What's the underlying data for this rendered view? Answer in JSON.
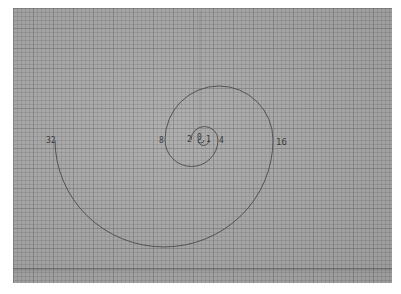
{
  "scene": {
    "description": "Photograph of grid paper with a hand-drawn spiral made of semicircular arcs whose diameters double",
    "paper_color": "#a9a9a9",
    "ink_color": "#4a4a4a"
  },
  "labels": {
    "zero": "0",
    "one": "1",
    "two": "2",
    "four": "4",
    "eight": "8",
    "sixteen": "16",
    "thirty_two": "32"
  }
}
